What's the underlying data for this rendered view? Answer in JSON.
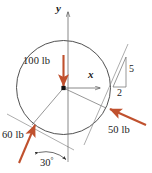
{
  "figure": {
    "type": "free-body-diagram",
    "background_color": "#ffffff",
    "force_color": "#c0512e",
    "line_color": "#4a4a4a",
    "text_color": "#1a1a1a"
  },
  "axes": {
    "y_label": "y",
    "x_label": "x",
    "origin": {
      "x": 63.5,
      "y": 88
    }
  },
  "body": {
    "shape": "circle",
    "center": {
      "x": 63.5,
      "y": 87.5
    },
    "radius": 47
  },
  "forces": [
    {
      "name": "force-100lb",
      "label": "100 lb",
      "magnitude": 100,
      "unit": "lb",
      "direction": "downward",
      "angle_deg": 270
    },
    {
      "name": "force-50lb",
      "label": "50 lb",
      "magnitude": 50,
      "unit": "lb",
      "direction": "up-left along 5:2 slope",
      "slope_rise": "5",
      "slope_run": "2"
    },
    {
      "name": "force-60lb",
      "label": "60 lb",
      "magnitude": 60,
      "unit": "lb",
      "direction": "up-right at 30 degrees",
      "angle_deg": 30
    }
  ],
  "annotations": {
    "slope_rise_label": "5",
    "slope_run_label": "2",
    "angle_label": "30",
    "angle_degree_symbol": "°"
  }
}
